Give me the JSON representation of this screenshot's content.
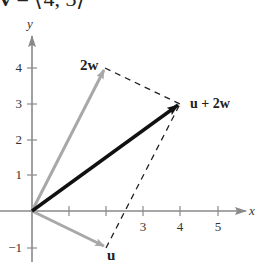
{
  "title": {
    "vector_symbol": "v",
    "equals": " = ",
    "value": "⟨4, 3⟩"
  },
  "diagram": {
    "type": "vector_addition_parallelogram",
    "axes": {
      "x_label": "x",
      "y_label": "y",
      "x_ticks": [
        {
          "value": 1,
          "label": ""
        },
        {
          "value": 2,
          "label": ""
        },
        {
          "value": 3,
          "label": "3"
        },
        {
          "value": 4,
          "label": "4"
        },
        {
          "value": 5,
          "label": "5"
        }
      ],
      "y_ticks": [
        {
          "value": -1,
          "label": "−1"
        },
        {
          "value": 1,
          "label": "1"
        },
        {
          "value": 2,
          "label": "2"
        },
        {
          "value": 3,
          "label": "3"
        },
        {
          "value": 4,
          "label": "4"
        }
      ]
    },
    "vectors": [
      {
        "name": "u",
        "label": "u",
        "from": [
          0,
          0
        ],
        "to": [
          2,
          -1
        ],
        "color": "#a8a8a8"
      },
      {
        "name": "2w",
        "label": "2w",
        "from": [
          0,
          0
        ],
        "to": [
          2,
          4
        ],
        "color": "#a8a8a8"
      },
      {
        "name": "u+2w",
        "label": "u + 2w",
        "from": [
          0,
          0
        ],
        "to": [
          4,
          3
        ],
        "color": "#111111"
      }
    ],
    "dashed_lines": [
      {
        "from": [
          2,
          4
        ],
        "to": [
          4,
          3
        ]
      },
      {
        "from": [
          2,
          -1
        ],
        "to": [
          4,
          3
        ]
      }
    ],
    "colors": {
      "axis": "#8a8a8a",
      "tick_text": "#333333",
      "dashed": "#222222"
    }
  }
}
